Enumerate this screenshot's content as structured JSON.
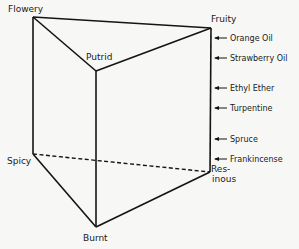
{
  "diagram": {
    "type": "odor-prism",
    "vertices": [
      {
        "id": "flowery",
        "label": "Flowery",
        "x": 33,
        "y": 17
      },
      {
        "id": "fruity",
        "label": "Fruity",
        "x": 211,
        "y": 28
      },
      {
        "id": "putrid",
        "label": "Putrid",
        "x": 96,
        "y": 71
      },
      {
        "id": "spicy",
        "label": "Spicy",
        "x": 33,
        "y": 154
      },
      {
        "id": "resinous",
        "label_line1": "Res-",
        "label_line2": "inous",
        "x": 210,
        "y": 172
      },
      {
        "id": "burnt",
        "label": "Burnt",
        "x": 96,
        "y": 227
      }
    ],
    "edges": [
      {
        "from": "flowery",
        "to": "fruity",
        "style": "solid"
      },
      {
        "from": "flowery",
        "to": "putrid",
        "style": "solid"
      },
      {
        "from": "putrid",
        "to": "fruity",
        "style": "solid"
      },
      {
        "from": "flowery",
        "to": "spicy",
        "style": "solid"
      },
      {
        "from": "putrid",
        "to": "burnt",
        "style": "solid"
      },
      {
        "from": "fruity",
        "to": "resinous",
        "style": "solid"
      },
      {
        "from": "spicy",
        "to": "burnt",
        "style": "solid"
      },
      {
        "from": "burnt",
        "to": "resinous",
        "style": "solid"
      },
      {
        "from": "spicy",
        "to": "resinous",
        "style": "dashed"
      }
    ],
    "edge_markers": [
      {
        "label": "Orange Oil",
        "y": 38
      },
      {
        "label": "Strawberry Oil",
        "y": 58
      },
      {
        "label": "Ethyl Ether",
        "y": 88
      },
      {
        "label": "Turpentine",
        "y": 108
      },
      {
        "label": "Spruce",
        "y": 139
      },
      {
        "label": "Frankincense",
        "y": 159
      }
    ]
  }
}
